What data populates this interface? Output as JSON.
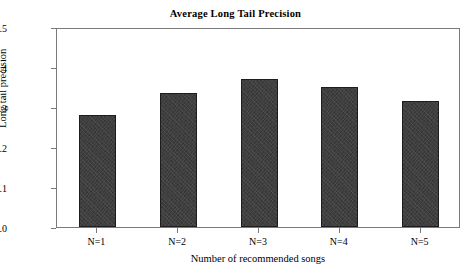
{
  "chart_data": {
    "type": "bar",
    "title": "Average Long Tail Precision",
    "xlabel": "Number of recommended songs",
    "ylabel": "Long tail precision",
    "categories": [
      "N=1",
      "N=2",
      "N=3",
      "N=4",
      "N=5"
    ],
    "values": [
      0.28,
      0.335,
      0.37,
      0.35,
      0.315
    ],
    "ylim": [
      0.0,
      0.5
    ],
    "yticks": [
      "0.0",
      "0.1",
      "0.2",
      "0.3",
      "0.4",
      "0.5"
    ],
    "ytick_values": [
      0.0,
      0.1,
      0.2,
      0.3,
      0.4,
      0.5
    ],
    "grid": false,
    "legend": null,
    "bar_color": "#3c3c3c",
    "frame_color": "#7a7a7a",
    "background": "#ffffff"
  }
}
